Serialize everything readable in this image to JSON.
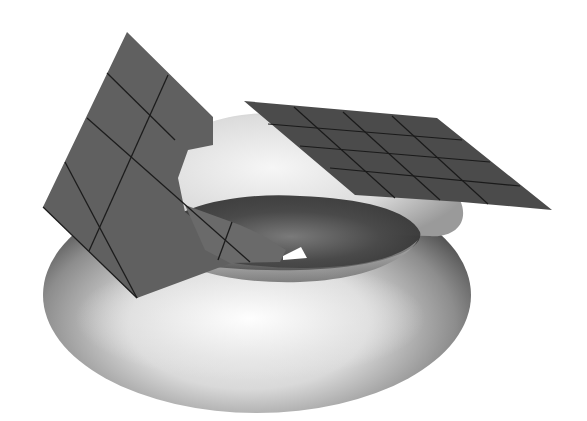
{
  "figure": {
    "title": "Torus with two tangent planes",
    "colors": {
      "background": "#ffffff",
      "plane_fill": "#5e5e5e",
      "plane_dark_fill": "#4a4a4a",
      "grid_line": "#1c1c1c",
      "torus_light": "#f2f2f2",
      "torus_dark": "#3a3a3a"
    },
    "objects": [
      {
        "id": "torus",
        "label": "torus"
      },
      {
        "id": "left-plane",
        "label": "tangent plane (outer side)",
        "grid": "3x4"
      },
      {
        "id": "right-plane",
        "label": "tangent plane (top)",
        "grid": "4x5"
      }
    ]
  }
}
